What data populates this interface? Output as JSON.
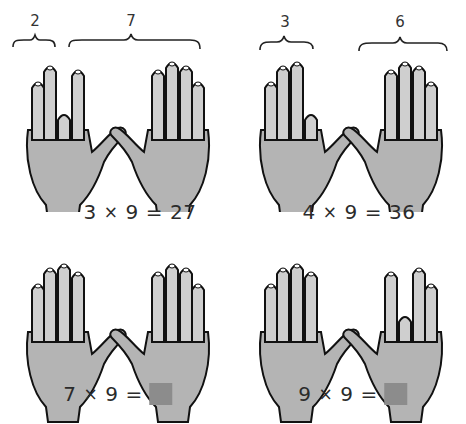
{
  "colors": {
    "skin": "#b4b4b4",
    "skin_light": "#cfcfcf",
    "outline": "#111111",
    "answer_box": "#8c8c8c"
  },
  "panels": [
    {
      "braces": [
        {
          "label": "2",
          "group": "left"
        },
        {
          "label": "7",
          "group": "right"
        }
      ],
      "folded_finger": 3,
      "equation": {
        "a": "3",
        "op": "×",
        "b": "9",
        "eq": "=",
        "result": "27",
        "result_hidden": false
      }
    },
    {
      "braces": [
        {
          "label": "3",
          "group": "left"
        },
        {
          "label": "6",
          "group": "right"
        }
      ],
      "folded_finger": 4,
      "equation": {
        "a": "4",
        "op": "×",
        "b": "9",
        "eq": "=",
        "result": "36",
        "result_hidden": false
      }
    },
    {
      "braces": [],
      "folded_finger": 7,
      "equation": {
        "a": "7",
        "op": "×",
        "b": "9",
        "eq": "=",
        "result": "",
        "result_hidden": true
      }
    },
    {
      "braces": [],
      "folded_finger": 9,
      "equation": {
        "a": "9",
        "op": "×",
        "b": "9",
        "eq": "=",
        "result": "",
        "result_hidden": true
      }
    }
  ]
}
